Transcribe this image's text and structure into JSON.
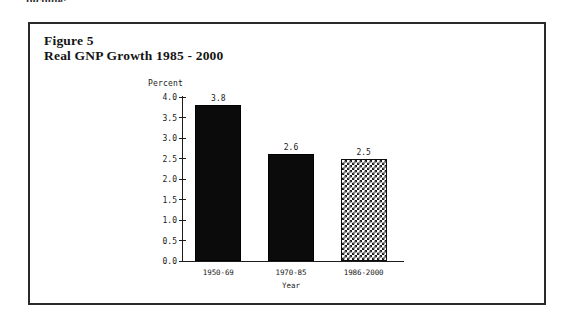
{
  "page": {
    "clipped_header_text": "include:"
  },
  "figure": {
    "title_line1": "Figure 5",
    "title_line2": "Real GNP Growth 1985 - 2000",
    "border_color": "#2a2a2a"
  },
  "chart_data": {
    "type": "bar",
    "title": "Real GNP Growth 1985 - 2000",
    "subtitle": "Figure 5",
    "xlabel": "Year",
    "ylabel": "Percent",
    "categories": [
      "1950-69",
      "1970-85",
      "1986-2000"
    ],
    "values": [
      3.8,
      2.6,
      2.5
    ],
    "value_labels": [
      "3.8",
      "2.6",
      "2.5"
    ],
    "ylim": [
      0.0,
      4.0
    ],
    "yticks": [
      "0.0",
      "0.5",
      "1.0",
      "1.5",
      "2.0",
      "2.5",
      "3.0",
      "3.5",
      "4.0"
    ],
    "ytick_values": [
      0.0,
      0.5,
      1.0,
      1.5,
      2.0,
      2.5,
      3.0,
      3.5,
      4.0
    ],
    "grid": false,
    "legend": false,
    "bar_styles": [
      "solid-black",
      "solid-black",
      "checkerboard-hatch"
    ],
    "colors": {
      "bar_solid": "#0b0b0b",
      "bar_hatch_fg": "#1a1a1a",
      "bar_hatch_bg": "#ffffff",
      "axis": "#1c1c1c",
      "text": "#141414"
    }
  }
}
